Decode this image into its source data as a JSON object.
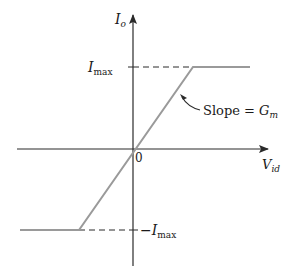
{
  "diagram": {
    "type": "transfer-characteristic",
    "y_axis": {
      "label": "I",
      "subscript": "o"
    },
    "x_axis": {
      "label": "V",
      "subscript": "id"
    },
    "origin_label": "0",
    "upper_level": {
      "label": "I",
      "subscript": "max"
    },
    "lower_level": {
      "label": "−I",
      "subscript": "max"
    },
    "slope_annotation": {
      "text": "Slope = ",
      "symbol": "G",
      "subscript": "m"
    },
    "colors": {
      "axis": "#2a2a2a",
      "curve": "#9a9a9a",
      "dashed": "#2a2a2a",
      "text": "#1a1a1a"
    }
  }
}
